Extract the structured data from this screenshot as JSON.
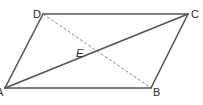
{
  "figure": {
    "type": "parallelogram",
    "vertices": {
      "A": {
        "label": "A",
        "x": 5,
        "y": 88
      },
      "B": {
        "label": "B",
        "x": 151,
        "y": 88
      },
      "C": {
        "label": "C",
        "x": 188,
        "y": 14
      },
      "D": {
        "label": "D",
        "x": 43,
        "y": 14
      }
    },
    "intersection": {
      "label": "E",
      "x": 92,
      "y": 53
    },
    "segments": [
      {
        "from": "A",
        "to": "B",
        "style": "solid"
      },
      {
        "from": "B",
        "to": "C",
        "style": "solid"
      },
      {
        "from": "C",
        "to": "D",
        "style": "solid"
      },
      {
        "from": "D",
        "to": "A",
        "style": "solid"
      },
      {
        "from": "A",
        "to": "C",
        "style": "solid",
        "name": "diagonal AC"
      },
      {
        "from": "D",
        "to": "B",
        "style": "dashed",
        "name": "diagonal DB"
      }
    ],
    "colors": {
      "stroke": "#4a4a4a",
      "label": "#2a2a2a"
    }
  }
}
